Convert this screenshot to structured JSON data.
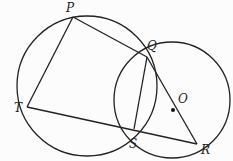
{
  "diagram": {
    "stroke_color": "#222222",
    "background": "#fcfcfc",
    "points": {
      "P": {
        "label": "P",
        "x": 73,
        "y": 17
      },
      "Q": {
        "label": "Q",
        "x": 147,
        "y": 57
      },
      "T": {
        "label": "T",
        "x": 27,
        "y": 107
      },
      "S": {
        "label": "S",
        "x": 134,
        "y": 129
      },
      "R": {
        "label": "R",
        "x": 197,
        "y": 144
      },
      "O": {
        "label": "O",
        "x": 172,
        "y": 110
      }
    },
    "circles": [
      {
        "name": "circle-PQST",
        "cx": 87,
        "cy": 86,
        "r": 70
      },
      {
        "name": "circle-O",
        "cx": 172,
        "cy": 100,
        "r": 58
      }
    ],
    "segments": [
      [
        "P",
        "Q"
      ],
      [
        "P",
        "T"
      ],
      [
        "T",
        "R"
      ],
      [
        "Q",
        "S"
      ],
      [
        "Q",
        "R"
      ]
    ]
  }
}
